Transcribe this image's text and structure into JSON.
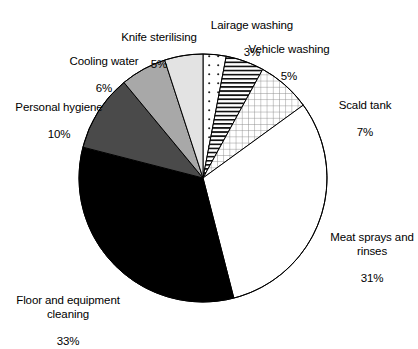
{
  "chart_data": {
    "type": "pie",
    "title": "",
    "xlabel": "",
    "ylabel": "",
    "legend_position": "none",
    "grid": false,
    "units": "percent",
    "start_angle_deg": 0,
    "direction": "clockwise",
    "categories": [
      "Lairage washing",
      "Vehicle washing",
      "Scald tank",
      "Meat sprays and rinses",
      "Floor and equipment cleaning",
      "Personal hygiene",
      "Cooling water",
      "Knife sterilising"
    ],
    "values": [
      3,
      5,
      7,
      31,
      33,
      10,
      6,
      5
    ],
    "slices": [
      {
        "label": "Lairage washing",
        "value": 3,
        "value_text": "3%",
        "fill": "dots",
        "color": "#ffffff",
        "stroke": "#000000"
      },
      {
        "label": "Vehicle washing",
        "value": 5,
        "value_text": "5%",
        "fill": "horizontal-lines",
        "color": "#ffffff",
        "stroke": "#000000"
      },
      {
        "label": "Scald tank",
        "value": 7,
        "value_text": "7%",
        "fill": "grid",
        "color": "#ffffff",
        "stroke": "#000000"
      },
      {
        "label": "Meat sprays and rinses",
        "value": 31,
        "value_text": "31%",
        "fill": "solid",
        "color": "#ffffff",
        "stroke": "#000000"
      },
      {
        "label": "Floor and equipment cleaning",
        "value": 33,
        "value_text": "33%",
        "fill": "solid",
        "color": "#000000",
        "stroke": "#000000"
      },
      {
        "label": "Personal hygiene",
        "value": 10,
        "value_text": "10%",
        "fill": "solid",
        "color": "#4a4a4a",
        "stroke": "#000000"
      },
      {
        "label": "Cooling water",
        "value": 6,
        "value_text": "6%",
        "fill": "solid",
        "color": "#a8a8a8",
        "stroke": "#000000"
      },
      {
        "label": "Knife sterilising",
        "value": 5,
        "value_text": "5%",
        "fill": "solid",
        "color": "#e3e3e3",
        "stroke": "#000000"
      }
    ]
  },
  "labels": {
    "lairage_washing": {
      "name": "Lairage washing",
      "pct": "3%"
    },
    "vehicle_washing": {
      "name": "Vehicle washing",
      "pct": "5%"
    },
    "scald_tank": {
      "name": "Scald tank",
      "pct": "7%"
    },
    "meat_sprays": {
      "name": "Meat sprays and\nrinses",
      "pct": "31%"
    },
    "floor_cleaning": {
      "name": "Floor and equipment\ncleaning",
      "pct": "33%"
    },
    "personal_hygiene": {
      "name": "Personal hygiene",
      "pct": "10%"
    },
    "cooling_water": {
      "name": "Cooling water",
      "pct": "6%"
    },
    "knife_sterilising": {
      "name": "Knife sterilising",
      "pct": "5%"
    }
  },
  "geometry": {
    "center_x": 203,
    "center_y": 178,
    "radius": 124
  },
  "colors": {
    "background": "#ffffff",
    "outline": "#000000",
    "text": "#000000",
    "dark_grey": "#4a4a4a",
    "mid_grey": "#a8a8a8",
    "light_grey": "#e3e3e3"
  }
}
